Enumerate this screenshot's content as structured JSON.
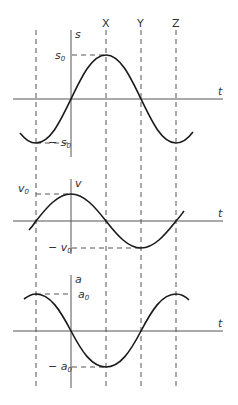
{
  "diagram": {
    "top_labels": [
      "X",
      "Y",
      "Z"
    ],
    "t_label": "t",
    "panels": [
      {
        "id": "displacement",
        "axis_label": "s",
        "amp_label": "s",
        "amp_sub": "0",
        "neg_amp_label": "− s",
        "neg_amp_sub": "0",
        "shape": "sine (starts at 0 rising at axis)"
      },
      {
        "id": "velocity",
        "axis_label": "v",
        "amp_label": "v",
        "amp_sub": "0",
        "neg_amp_label": "− v",
        "neg_amp_sub": "0",
        "shape": "cosine (max at axis)"
      },
      {
        "id": "acceleration",
        "axis_label": "a",
        "amp_label": "a",
        "amp_sub": "0",
        "neg_amp_label": "− a",
        "neg_amp_sub": "0",
        "shape": "negative sine (max at first dashed line)"
      }
    ]
  }
}
